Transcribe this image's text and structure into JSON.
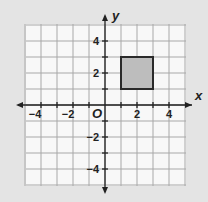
{
  "figure": {
    "type": "coordinate-plane",
    "x_axis_label": "x",
    "y_axis_label": "y",
    "origin_label": "O",
    "x_range": [
      -5,
      5
    ],
    "y_range": [
      -5,
      5
    ],
    "grid_step": 1,
    "x_tick_labels": [
      "−4",
      "−2",
      "2",
      "4"
    ],
    "y_tick_labels": [
      "4",
      "2",
      "−2",
      "−4"
    ],
    "shape": {
      "type": "square",
      "vertices": [
        [
          1,
          1
        ],
        [
          3,
          1
        ],
        [
          3,
          3
        ],
        [
          1,
          3
        ]
      ],
      "fill": "#bdbdbd",
      "stroke": "#2a2a2a"
    },
    "colors": {
      "background": "#e4e4e4",
      "grid_fill": "#f8f8f8",
      "grid_lines": "#a8a8a8",
      "axes": "#222222"
    }
  }
}
